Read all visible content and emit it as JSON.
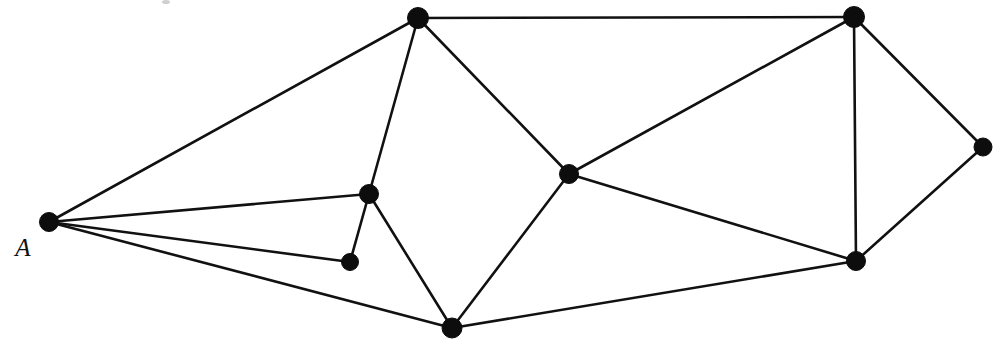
{
  "figure": {
    "type": "node-link-graph",
    "background_color": "#ffffff",
    "ink_color": "#111111",
    "width": 995,
    "height": 359
  },
  "labels": {
    "vertex_a": "A"
  },
  "graph_data": {
    "type": "graph",
    "directed": false,
    "vertex_count": 9,
    "edge_count": 16,
    "vertices": [
      {
        "id": "A",
        "label": "A",
        "x": 49,
        "y": 222,
        "r": 9.5,
        "degree": 4,
        "label_x": 23,
        "label_y": 256
      },
      {
        "id": "B",
        "label": "",
        "x": 418,
        "y": 18,
        "r": 10.5,
        "degree": 4,
        "label_x": 0,
        "label_y": 0
      },
      {
        "id": "C",
        "label": "",
        "x": 854,
        "y": 17,
        "r": 10.5,
        "degree": 4,
        "label_x": 0,
        "label_y": 0
      },
      {
        "id": "D",
        "label": "",
        "x": 369,
        "y": 194,
        "r": 9.5,
        "degree": 4,
        "label_x": 0,
        "label_y": 0
      },
      {
        "id": "E",
        "label": "",
        "x": 350,
        "y": 262,
        "r": 8.5,
        "degree": 2,
        "label_x": 0,
        "label_y": 0
      },
      {
        "id": "F",
        "label": "",
        "x": 569,
        "y": 174,
        "r": 9.5,
        "degree": 4,
        "label_x": 0,
        "label_y": 0
      },
      {
        "id": "G",
        "label": "",
        "x": 983,
        "y": 147,
        "r": 9.0,
        "degree": 2,
        "label_x": 0,
        "label_y": 0
      },
      {
        "id": "H",
        "label": "",
        "x": 856,
        "y": 261,
        "r": 9.5,
        "degree": 4,
        "label_x": 0,
        "label_y": 0
      },
      {
        "id": "I",
        "label": "",
        "x": 452,
        "y": 328,
        "r": 10.0,
        "degree": 4,
        "label_x": 0,
        "label_y": 0
      }
    ],
    "edges": [
      {
        "source": "A",
        "target": "B",
        "x1": 49,
        "y1": 222,
        "x2": 418,
        "y2": 18
      },
      {
        "source": "A",
        "target": "D",
        "x1": 49,
        "y1": 222,
        "x2": 369,
        "y2": 194
      },
      {
        "source": "A",
        "target": "E",
        "x1": 49,
        "y1": 222,
        "x2": 350,
        "y2": 262
      },
      {
        "source": "A",
        "target": "I",
        "x1": 49,
        "y1": 222,
        "x2": 452,
        "y2": 328
      },
      {
        "source": "B",
        "target": "C",
        "x1": 418,
        "y1": 18,
        "x2": 854,
        "y2": 17
      },
      {
        "source": "B",
        "target": "D",
        "x1": 418,
        "y1": 18,
        "x2": 369,
        "y2": 194
      },
      {
        "source": "B",
        "target": "F",
        "x1": 418,
        "y1": 18,
        "x2": 569,
        "y2": 174
      },
      {
        "source": "C",
        "target": "F",
        "x1": 854,
        "y1": 17,
        "x2": 569,
        "y2": 174
      },
      {
        "source": "C",
        "target": "G",
        "x1": 854,
        "y1": 17,
        "x2": 983,
        "y2": 147
      },
      {
        "source": "C",
        "target": "H",
        "x1": 854,
        "y1": 17,
        "x2": 856,
        "y2": 261
      },
      {
        "source": "D",
        "target": "E",
        "x1": 369,
        "y1": 194,
        "x2": 350,
        "y2": 262
      },
      {
        "source": "D",
        "target": "I",
        "x1": 369,
        "y1": 194,
        "x2": 452,
        "y2": 328
      },
      {
        "source": "F",
        "target": "H",
        "x1": 569,
        "y1": 174,
        "x2": 856,
        "y2": 261
      },
      {
        "source": "F",
        "target": "I",
        "x1": 569,
        "y1": 174,
        "x2": 452,
        "y2": 328
      },
      {
        "source": "G",
        "target": "H",
        "x1": 983,
        "y1": 147,
        "x2": 856,
        "y2": 261
      },
      {
        "source": "H",
        "target": "I",
        "x1": 856,
        "y1": 261,
        "x2": 452,
        "y2": 328
      }
    ],
    "artifacts": [
      {
        "id": "speck-top",
        "x": 166,
        "y": 2,
        "rx": 4,
        "ry": 2
      }
    ]
  }
}
